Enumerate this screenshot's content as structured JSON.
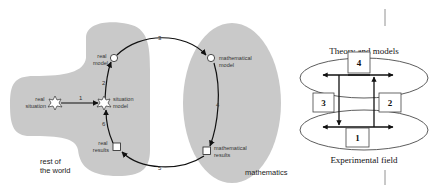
{
  "left_diagram": {
    "regions": {
      "rest_of_world": "rest of\nthe world",
      "rest_of_world_lines": [
        "rest of",
        "the world"
      ],
      "mathematics": "mathematics"
    },
    "nodes": {
      "real_situation": [
        "real",
        "situation"
      ],
      "situation_model": [
        "situation",
        "model"
      ],
      "real_model": [
        "real",
        "model"
      ],
      "mathematical_model": [
        "mathematical",
        "model"
      ],
      "mathematical_results": [
        "mathematical",
        "results"
      ],
      "real_results": [
        "real",
        "results"
      ]
    },
    "steps": [
      "1",
      "2",
      "3",
      "4",
      "5",
      "6"
    ],
    "colors": {
      "region_fill": "#c9c9c9",
      "line": "#111111"
    }
  },
  "right_diagram": {
    "top_label": "Theory and models",
    "bottom_label": "Experimental field",
    "boxes": [
      "1",
      "2",
      "3",
      "4"
    ]
  }
}
